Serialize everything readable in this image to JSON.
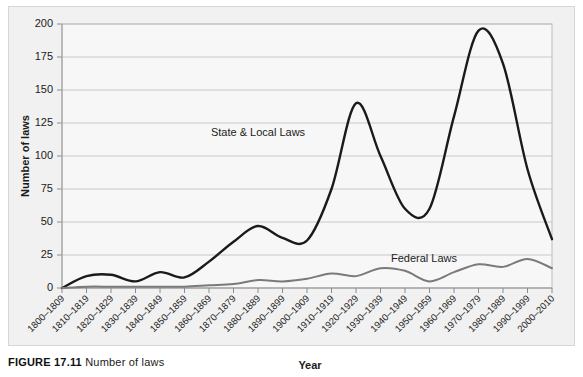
{
  "figure": {
    "caption_label": "FIGURE 17.11",
    "caption_text": "Number of laws"
  },
  "chart_data": {
    "type": "line",
    "title": "",
    "xlabel": "Year",
    "ylabel": "Number of laws",
    "ylim": [
      0,
      200
    ],
    "ytick_step": 25,
    "yticks": [
      "0",
      "25",
      "50",
      "75",
      "100",
      "125",
      "150",
      "175",
      "200"
    ],
    "grid": true,
    "legend_position": "inline-annotations",
    "categories": [
      "1800–1809",
      "1810–1819",
      "1820–1829",
      "1830–1839",
      "1840–1849",
      "1850–1859",
      "1860–1869",
      "1870–1879",
      "1880–1889",
      "1890–1899",
      "1900–1909",
      "1910–1919",
      "1920–1929",
      "1930–1939",
      "1940–1949",
      "1950–1959",
      "1960–1969",
      "1970–1979",
      "1980–1989",
      "1990–1999",
      "2000–2010"
    ],
    "series": [
      {
        "name": "State & Local Laws",
        "color": "#1a1a1a",
        "values": [
          0,
          9,
          10,
          5,
          12,
          8,
          20,
          35,
          47,
          38,
          36,
          75,
          140,
          100,
          60,
          60,
          130,
          195,
          170,
          90,
          37
        ]
      },
      {
        "name": "Federal Laws",
        "color": "#7a7a7a",
        "values": [
          0,
          1,
          1,
          1,
          1,
          1,
          2,
          3,
          6,
          5,
          7,
          11,
          9,
          15,
          13,
          5,
          12,
          18,
          16,
          22,
          15
        ]
      }
    ],
    "annotations": [
      {
        "text": "State & Local Laws",
        "series": "State & Local Laws"
      },
      {
        "text": "Federal Laws",
        "series": "Federal Laws"
      }
    ]
  }
}
